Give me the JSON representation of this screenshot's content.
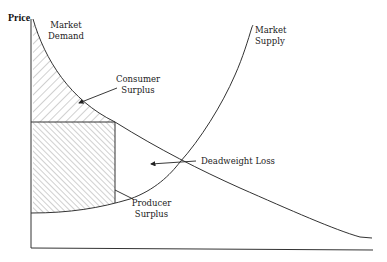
{
  "diagram": {
    "axes": {
      "y_label": "Price",
      "x_label": ""
    },
    "curves": {
      "demand": {
        "label_line1": "Market",
        "label_line2": "Demand"
      },
      "supply": {
        "label_line1": "Market",
        "label_line2": "Supply"
      }
    },
    "regions": {
      "consumer_surplus": {
        "label_line1": "Consumer",
        "label_line2": "Surplus",
        "fill": "diagonal-hatch-forward"
      },
      "producer_surplus": {
        "label_line1": "Producer",
        "label_line2": "Surplus",
        "fill": "diagonal-hatch-backward"
      },
      "deadweight_loss": {
        "label": "Deadweight Loss"
      }
    },
    "colors": {
      "line": "#333333",
      "hatch": "#777777",
      "background": "#ffffff"
    }
  }
}
